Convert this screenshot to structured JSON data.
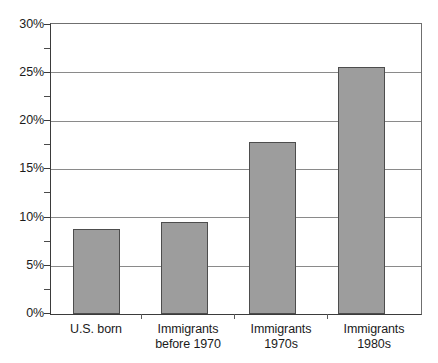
{
  "chart_data": {
    "type": "bar",
    "title": "",
    "subtitle": "",
    "xlabel": "",
    "ylabel": "",
    "categories": [
      "U.S. born",
      "Immigrants before 1970",
      "Immigrants 1970s",
      "Immigrants 1980s"
    ],
    "category_lines": [
      [
        "U.S. born",
        ""
      ],
      [
        "Immigrants",
        "before 1970"
      ],
      [
        "Immigrants",
        "1970s"
      ],
      [
        "Immigrants",
        "1980s"
      ]
    ],
    "values": [
      8.8,
      9.5,
      17.8,
      25.6
    ],
    "value_unit": "%",
    "ylim": [
      0,
      30
    ],
    "y_major_step": 5,
    "y_minor_step": 2.5,
    "y_tick_labels": [
      "0%",
      "5%",
      "10%",
      "15%",
      "20%",
      "25%",
      "30%"
    ],
    "y_tick_values": [
      0,
      5,
      10,
      15,
      20,
      25,
      30
    ],
    "y_minor_tick_values": [
      2.5,
      7.5,
      12.5,
      17.5,
      22.5,
      27.5
    ],
    "grid": "horizontal",
    "legend": "none",
    "bar_color": "#9d9d9d",
    "bar_border_color": "#4d4d4d",
    "axis_color": "#3b3b3b",
    "gridline_color": "#8a8a8a",
    "background_color": "#ffffff",
    "series": [
      {
        "name": "Percent",
        "values": [
          8.8,
          9.5,
          17.8,
          25.6
        ]
      }
    ]
  }
}
